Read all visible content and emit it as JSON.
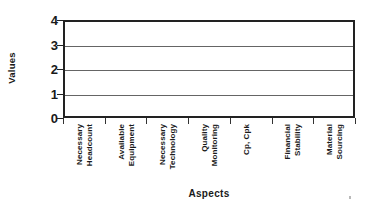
{
  "chart_data": {
    "type": "bar",
    "title": "",
    "xlabel": "Aspects",
    "ylabel": "Values",
    "categories": [
      "Necessary Headcount",
      "Available Equipment",
      "Necessary Technology",
      "Quality Monitoring",
      "Cp, Cpk",
      "Financial Stability",
      "Material Sourcing"
    ],
    "category_lines": [
      [
        "Necessary",
        "Headcount"
      ],
      [
        "Available",
        "Equipment"
      ],
      [
        "Necessary",
        "Technology"
      ],
      [
        "Quality",
        "Monitoring"
      ],
      [
        "Cp, Cpk"
      ],
      [
        "Financial",
        "Stability"
      ],
      [
        "Material",
        "Sourcing"
      ]
    ],
    "values": [
      0,
      0,
      0,
      0,
      0,
      0,
      0
    ],
    "ylim": [
      0,
      4
    ],
    "yticks": [
      0,
      1,
      2,
      3,
      4
    ],
    "ytick_labels": [
      "0",
      "1",
      "2",
      "3",
      "4"
    ],
    "gridlines": [
      1,
      2,
      3
    ],
    "grid": true,
    "legend": "none",
    "note": "plot area rendered empty - no bars visible"
  },
  "axes": {
    "y_title": "Values",
    "x_title": "Aspects"
  },
  "colors": {
    "frame": "#222222",
    "grid": "#4a4a4a",
    "text": "#1a1a1a",
    "background": "#ffffff"
  }
}
